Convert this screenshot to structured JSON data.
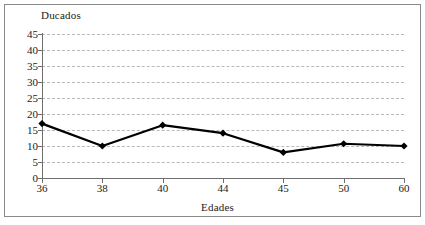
{
  "chart_data": {
    "type": "line",
    "title": "",
    "xlabel": "Edades",
    "ylabel": "Ducados",
    "categories": [
      "36",
      "38",
      "40",
      "44",
      "45",
      "50",
      "60"
    ],
    "values": [
      17,
      10,
      16.5,
      14,
      8,
      10.7,
      10
    ],
    "series": [
      {
        "name": "Ducados",
        "values": [
          17,
          10,
          16.5,
          14,
          8,
          10.7,
          10
        ]
      }
    ],
    "ylim": [
      0,
      45
    ],
    "y_ticks": [
      0,
      5,
      10,
      15,
      20,
      25,
      30,
      35,
      40,
      45
    ],
    "y_tick_labels": [
      "0",
      "5",
      "10",
      "15",
      "20",
      "25",
      "30",
      "35",
      "40",
      "45"
    ],
    "x_tick_labels": [
      "36",
      "38",
      "40",
      "44",
      "45",
      "50",
      "60"
    ],
    "grid": true,
    "grid_axis": "y",
    "grid_style": "dashed",
    "legend": false,
    "legend_position": "none",
    "marker": "diamond",
    "line_color": "#000000",
    "marker_color": "#000000",
    "grid_color": "#b9b9b9",
    "axis_color": "#6f6f6f",
    "background_color": "#ffffff",
    "border_color": "#8a8a8a"
  },
  "axes": {
    "y_title": "Ducados",
    "x_title": "Edades"
  }
}
